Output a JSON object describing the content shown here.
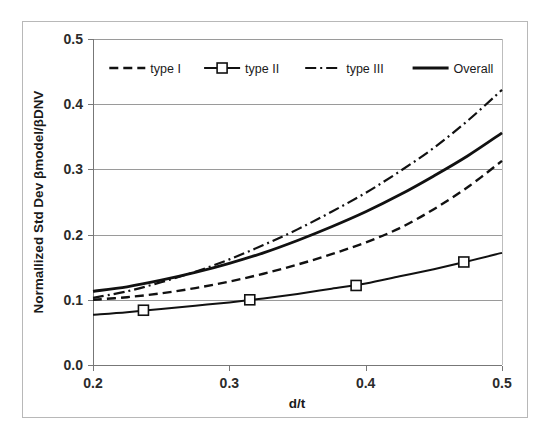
{
  "chart_data": {
    "type": "line",
    "title": "",
    "xlabel": "d/t",
    "ylabel": "Normallized Std Dev βmodel/βDNV",
    "xlim": [
      0.2,
      0.5
    ],
    "ylim": [
      0.0,
      0.5
    ],
    "xticks": [
      "0.2",
      "0.3",
      "0.4",
      "0.5"
    ],
    "xtick_values": [
      0.2,
      0.3,
      0.4,
      0.5
    ],
    "yticks": [
      "0.0",
      "0.1",
      "0.2",
      "0.3",
      "0.4",
      "0.5"
    ],
    "ytick_values": [
      0.0,
      0.1,
      0.2,
      0.3,
      0.4,
      0.5
    ],
    "grid": "horizontal",
    "legend_position": "top-inside",
    "series": [
      {
        "name": "type I",
        "style": "dashed",
        "marker": "none",
        "color": "#111111",
        "x": [
          0.2,
          0.225,
          0.25,
          0.275,
          0.3,
          0.325,
          0.35,
          0.375,
          0.4,
          0.425,
          0.45,
          0.475,
          0.5
        ],
        "values": [
          0.1,
          0.104,
          0.11,
          0.118,
          0.128,
          0.14,
          0.154,
          0.17,
          0.188,
          0.21,
          0.239,
          0.273,
          0.313
        ]
      },
      {
        "name": "type II",
        "style": "solid",
        "marker": "square",
        "color": "#111111",
        "x": [
          0.2,
          0.225,
          0.25,
          0.275,
          0.3,
          0.325,
          0.35,
          0.375,
          0.4,
          0.425,
          0.45,
          0.475,
          0.5
        ],
        "values": [
          0.077,
          0.081,
          0.086,
          0.091,
          0.096,
          0.102,
          0.109,
          0.117,
          0.125,
          0.136,
          0.147,
          0.159,
          0.172
        ],
        "marker_x": [
          0.237,
          0.315,
          0.393,
          0.472
        ],
        "marker_values": [
          0.084,
          0.1,
          0.122,
          0.158
        ]
      },
      {
        "name": "type III",
        "style": "dash-dot",
        "marker": "none",
        "color": "#111111",
        "x": [
          0.2,
          0.225,
          0.25,
          0.275,
          0.3,
          0.325,
          0.35,
          0.375,
          0.4,
          0.425,
          0.45,
          0.475,
          0.5
        ],
        "values": [
          0.103,
          0.113,
          0.127,
          0.143,
          0.162,
          0.184,
          0.208,
          0.235,
          0.264,
          0.297,
          0.333,
          0.375,
          0.422
        ]
      },
      {
        "name": "Overall",
        "style": "solid-thick",
        "marker": "none",
        "color": "#111111",
        "x": [
          0.2,
          0.225,
          0.25,
          0.275,
          0.3,
          0.325,
          0.35,
          0.375,
          0.4,
          0.425,
          0.45,
          0.475,
          0.5
        ],
        "values": [
          0.113,
          0.12,
          0.13,
          0.142,
          0.156,
          0.172,
          0.191,
          0.212,
          0.235,
          0.261,
          0.29,
          0.321,
          0.356
        ]
      }
    ]
  },
  "legend": {
    "items": [
      {
        "label": "type I"
      },
      {
        "label": "type II"
      },
      {
        "label": "type III"
      },
      {
        "label": "Overall"
      }
    ]
  },
  "axes": {
    "x_title": "d/t",
    "y_title": "Normallized Std Dev βmodel/βDNV"
  },
  "colors": {
    "line": "#111111",
    "grid": "#9a9a9a",
    "axis": "#777777",
    "frame": "#b8b8b8",
    "background": "#ffffff",
    "text": "#1a1a1a"
  }
}
